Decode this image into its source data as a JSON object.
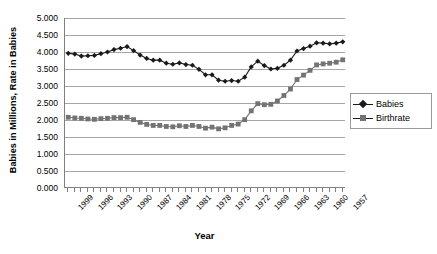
{
  "chart_data": {
    "type": "line",
    "title": "",
    "xlabel": "Year",
    "ylabel": "Babies in Millions, Rate in Babies",
    "ylim": [
      0.0,
      5.0
    ],
    "ytick_step": 0.5,
    "ytick_labels": [
      "5.000",
      "4.500",
      "4.000",
      "3.500",
      "3.000",
      "2.500",
      "2.000",
      "1.500",
      "1.000",
      "0.500",
      "0.000"
    ],
    "ytick_values": [
      5.0,
      4.5,
      4.0,
      3.5,
      3.0,
      2.5,
      2.0,
      1.5,
      1.0,
      0.5,
      0.0
    ],
    "grid": true,
    "grid_axis": "y",
    "legend_position": "right",
    "x_axis_direction": "descending",
    "xtick_label_rotation": -45,
    "xtick_label_interval": 3,
    "x": [
      1999,
      1998,
      1997,
      1996,
      1995,
      1994,
      1993,
      1992,
      1991,
      1990,
      1989,
      1988,
      1987,
      1986,
      1985,
      1984,
      1983,
      1982,
      1981,
      1980,
      1979,
      1978,
      1977,
      1976,
      1975,
      1974,
      1973,
      1972,
      1971,
      1970,
      1969,
      1968,
      1967,
      1966,
      1965,
      1964,
      1963,
      1962,
      1961,
      1960,
      1959,
      1958,
      1957
    ],
    "xtick_labels": [
      "1999",
      "1996",
      "1993",
      "1990",
      "1987",
      "1984",
      "1981",
      "1978",
      "1975",
      "1972",
      "1969",
      "1966",
      "1963",
      "1960",
      "1957"
    ],
    "series": [
      {
        "name": "Babies",
        "marker": "diamond",
        "color": "#1a1a1a",
        "values": [
          3.96,
          3.94,
          3.88,
          3.89,
          3.9,
          3.95,
          4.0,
          4.07,
          4.11,
          4.16,
          4.04,
          3.91,
          3.81,
          3.76,
          3.76,
          3.67,
          3.64,
          3.68,
          3.63,
          3.61,
          3.49,
          3.33,
          3.33,
          3.17,
          3.14,
          3.16,
          3.14,
          3.26,
          3.56,
          3.73,
          3.6,
          3.5,
          3.52,
          3.61,
          3.76,
          4.03,
          4.1,
          4.17,
          4.27,
          4.26,
          4.24,
          4.26,
          4.3
        ]
      },
      {
        "name": "Birthrate",
        "marker": "square",
        "color": "#737373",
        "values": [
          2.08,
          2.06,
          2.05,
          2.03,
          2.02,
          2.04,
          2.05,
          2.07,
          2.07,
          2.08,
          2.01,
          1.93,
          1.87,
          1.84,
          1.84,
          1.81,
          1.8,
          1.83,
          1.81,
          1.84,
          1.81,
          1.76,
          1.79,
          1.74,
          1.77,
          1.84,
          1.88,
          2.01,
          2.27,
          2.48,
          2.45,
          2.46,
          2.56,
          2.72,
          2.91,
          3.19,
          3.32,
          3.46,
          3.62,
          3.65,
          3.67,
          3.7,
          3.77
        ]
      }
    ]
  },
  "axis": {
    "y_title": "Babies in Millions, Rate in Babies",
    "x_title": "Year"
  },
  "legend": {
    "items": [
      {
        "label": "Babies",
        "marker": "diamond-marker-icon"
      },
      {
        "label": "Birthrate",
        "marker": "square-marker-icon"
      }
    ]
  }
}
